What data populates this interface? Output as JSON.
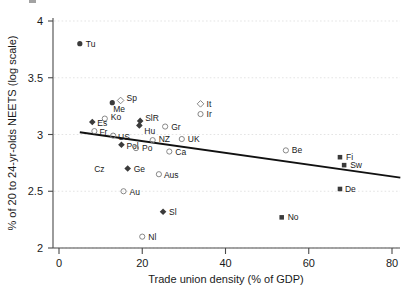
{
  "chart_data": {
    "type": "scatter",
    "title": "",
    "xlabel": "Trade union density (% of GDP)",
    "ylabel": "% of 20 to 24-yr-olds NEETS (log scale)",
    "xlim": [
      0,
      80
    ],
    "ylim": [
      2,
      4
    ],
    "xticks": [
      0,
      20,
      40,
      60,
      80
    ],
    "yticks": [
      2,
      2.5,
      3,
      3.5,
      4
    ],
    "xticklabels": [
      "0",
      "20",
      "40",
      "60",
      "80"
    ],
    "yticklabels": [
      "2",
      "2.5",
      "3",
      "3.5",
      "4"
    ],
    "grid": "horizontal-dotted",
    "legend": "none",
    "marker_styles": {
      "open-circle": "hollow circle, grey outline",
      "open-diamond": "hollow diamond, grey outline",
      "filled-circle": "solid dark circle",
      "filled-diamond": "solid dark diamond",
      "filled-square": "solid dark square"
    },
    "points": [
      {
        "label": "Tu",
        "x": 5.0,
        "y": 3.8,
        "marker": "filled-circle",
        "label_dx": 6,
        "label_dy": 3
      },
      {
        "label": "Sp",
        "x": 14.8,
        "y": 3.3,
        "marker": "open-diamond",
        "label_dx": 6,
        "label_dy": 1
      },
      {
        "label": "Me",
        "x": 12.8,
        "y": 3.28,
        "marker": "filled-circle",
        "label_dx": 1,
        "label_dy": 9
      },
      {
        "label": "It",
        "x": 34.0,
        "y": 3.27,
        "marker": "open-diamond",
        "label_dx": 6,
        "label_dy": 3
      },
      {
        "label": "Ir",
        "x": 34.0,
        "y": 3.18,
        "marker": "open-circle",
        "label_dx": 6,
        "label_dy": 3
      },
      {
        "label": "Ko",
        "x": 11.0,
        "y": 3.14,
        "marker": "open-circle",
        "label_dx": 6,
        "label_dy": 1
      },
      {
        "label": "Es",
        "x": 8.0,
        "y": 3.11,
        "marker": "filled-diamond",
        "label_dx": 5,
        "label_dy": 4
      },
      {
        "label": "SlR",
        "x": 19.5,
        "y": 3.12,
        "marker": "filled-diamond",
        "label_dx": 5,
        "label_dy": 0
      },
      {
        "label": "Hu",
        "x": 19.3,
        "y": 3.08,
        "marker": "filled-diamond",
        "label_dx": 5,
        "label_dy": 9
      },
      {
        "label": "Gr",
        "x": 25.5,
        "y": 3.07,
        "marker": "open-circle",
        "label_dx": 6,
        "label_dy": 3
      },
      {
        "label": "Fr",
        "x": 8.5,
        "y": 3.03,
        "marker": "open-circle",
        "label_dx": 5,
        "label_dy": 4
      },
      {
        "label": "US",
        "x": 13.0,
        "y": 2.99,
        "marker": "open-circle",
        "label_dx": 5,
        "label_dy": 4
      },
      {
        "label": "NZ",
        "x": 22.5,
        "y": 2.95,
        "marker": "open-circle",
        "label_dx": 6,
        "label_dy": 2
      },
      {
        "label": "UK",
        "x": 29.5,
        "y": 2.96,
        "marker": "open-circle",
        "label_dx": 6,
        "label_dy": 3
      },
      {
        "label": "Pol",
        "x": 15.0,
        "y": 2.91,
        "marker": "filled-diamond",
        "label_dx": 5,
        "label_dy": 4
      },
      {
        "label": "Po",
        "x": 18.5,
        "y": 2.88,
        "marker": "open-circle",
        "label_dx": 6,
        "label_dy": 3
      },
      {
        "label": "Ca",
        "x": 26.5,
        "y": 2.85,
        "marker": "open-circle",
        "label_dx": 6,
        "label_dy": 3
      },
      {
        "label": "Be",
        "x": 54.5,
        "y": 2.86,
        "marker": "open-circle",
        "label_dx": 6,
        "label_dy": 3
      },
      {
        "label": "Fi",
        "x": 67.5,
        "y": 2.8,
        "marker": "filled-square",
        "label_dx": 6,
        "label_dy": 3
      },
      {
        "label": "Sw",
        "x": 68.5,
        "y": 2.73,
        "marker": "filled-square",
        "label_dx": 6,
        "label_dy": 3
      },
      {
        "label": "Ge",
        "x": 16.5,
        "y": 2.7,
        "marker": "filled-diamond",
        "label_dx": 6,
        "label_dy": 3
      },
      {
        "label": "Cz",
        "x": 14.3,
        "y": 2.7,
        "marker": "none",
        "label_dx": -14,
        "label_dy": 3
      },
      {
        "label": "Aus",
        "x": 24.0,
        "y": 2.65,
        "marker": "open-circle",
        "label_dx": 5,
        "label_dy": 4
      },
      {
        "label": "De",
        "x": 67.5,
        "y": 2.52,
        "marker": "filled-square",
        "label_dx": 5,
        "label_dy": 3
      },
      {
        "label": "Au",
        "x": 15.5,
        "y": 2.5,
        "marker": "open-circle",
        "label_dx": 6,
        "label_dy": 4
      },
      {
        "label": "Sl",
        "x": 25.0,
        "y": 2.32,
        "marker": "filled-diamond",
        "label_dx": 6,
        "label_dy": 3
      },
      {
        "label": "No",
        "x": 53.5,
        "y": 2.27,
        "marker": "filled-square",
        "label_dx": 6,
        "label_dy": 3
      },
      {
        "label": "Nl",
        "x": 20.0,
        "y": 2.1,
        "marker": "open-circle",
        "label_dx": 6,
        "label_dy": 3
      }
    ],
    "trendline": {
      "x1": 5.0,
      "y1": 3.02,
      "x2": 82.0,
      "y2": 2.62,
      "style": "solid-black-linear-fit"
    }
  },
  "colors": {
    "axis": "#4a4a4a",
    "grid": "#d9d9d9",
    "trendline": "#111111",
    "marker_fill": "#3b3b3b",
    "marker_outline": "#7a7a7a",
    "text": "#1a1a1a",
    "background": "#ffffff"
  }
}
